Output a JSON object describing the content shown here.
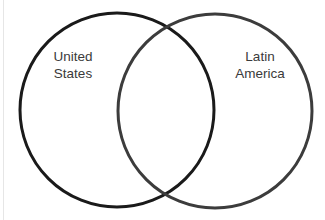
{
  "diagram": {
    "type": "venn",
    "sets": [
      {
        "name": "united-states",
        "label_lines": [
          "United",
          "States"
        ],
        "stroke_color": "#1a1a1a",
        "center": [
          117,
          110
        ],
        "radius": 97
      },
      {
        "name": "latin-america",
        "label_lines": [
          "Latin",
          "America"
        ],
        "stroke_color": "#3c3c3c",
        "center": [
          215,
          111
        ],
        "radius": 97
      }
    ],
    "label_color": "#3a3a3a",
    "background": "#ffffff"
  }
}
